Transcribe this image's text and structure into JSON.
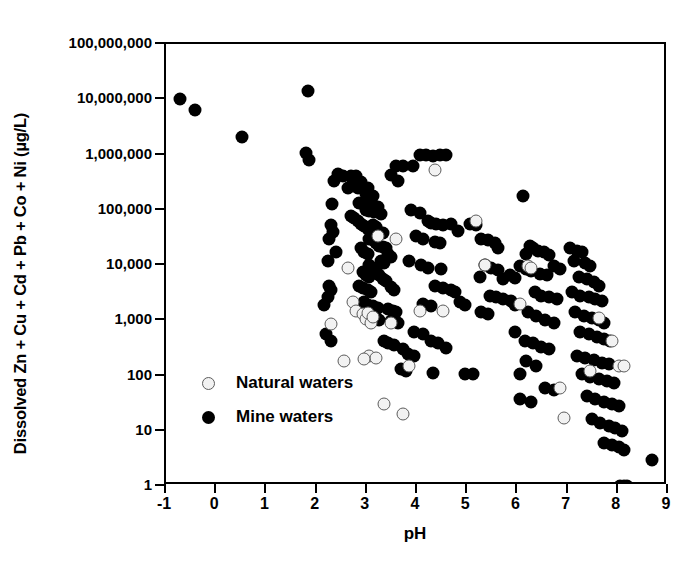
{
  "chart_data": {
    "type": "scatter",
    "title": "",
    "xlabel": "pH",
    "ylabel": "Dissolved Zn + Cu + Cd + Pb + Co + Ni (µg/L)",
    "xlim": [
      -1,
      9
    ],
    "ylim": [
      1,
      100000000
    ],
    "yscale": "log",
    "xticks": [
      "-1",
      "0",
      "1",
      "2",
      "3",
      "4",
      "5",
      "6",
      "7",
      "8",
      "9"
    ],
    "xtick_values": [
      -1,
      0,
      1,
      2,
      3,
      4,
      5,
      6,
      7,
      8,
      9
    ],
    "ytick_values": [
      1,
      10,
      100,
      1000,
      10000,
      100000,
      1000000,
      10000000,
      100000000
    ],
    "yticks": [
      "1",
      "10",
      "100",
      "1,000",
      "10,000",
      "100,000",
      "1,000,000",
      "10,000,000",
      "100,000,000"
    ],
    "grid": false,
    "legend_position": "inside-bottom-left",
    "series": [
      {
        "name": "Natural waters",
        "marker": "open-circle",
        "color": "#f2f2f2",
        "edge_color": "#5c5c5c",
        "points": [
          [
            2.28,
            850
          ],
          [
            2.62,
            9000
          ],
          [
            2.72,
            2100
          ],
          [
            2.78,
            1500
          ],
          [
            2.92,
            1300
          ],
          [
            2.98,
            1050
          ],
          [
            3.02,
            1350
          ],
          [
            3.08,
            900
          ],
          [
            3.12,
            1150
          ],
          [
            3.05,
            230
          ],
          [
            3.18,
            210
          ],
          [
            2.95,
            200
          ],
          [
            2.55,
            180
          ],
          [
            3.35,
            30
          ],
          [
            3.72,
            20
          ],
          [
            3.48,
            900
          ],
          [
            3.85,
            150
          ],
          [
            3.22,
            33000
          ],
          [
            3.58,
            30000
          ],
          [
            4.05,
            1500
          ],
          [
            4.35,
            520000
          ],
          [
            4.52,
            1500
          ],
          [
            5.18,
            62000
          ],
          [
            5.35,
            10000
          ],
          [
            6.22,
            9500
          ],
          [
            6.28,
            9000
          ],
          [
            6.05,
            2000
          ],
          [
            6.92,
            17
          ],
          [
            7.62,
            1100
          ],
          [
            7.88,
            430
          ],
          [
            8.02,
            150
          ],
          [
            8.12,
            150
          ],
          [
            7.45,
            120
          ],
          [
            6.85,
            60
          ]
        ]
      },
      {
        "name": "Mine waters",
        "marker": "filled-circle",
        "color": "#000000",
        "points": [
          [
            -0.72,
            10000000
          ],
          [
            -0.42,
            6500000
          ],
          [
            0.52,
            2100000
          ],
          [
            1.82,
            14000000
          ],
          [
            1.78,
            1050000
          ],
          [
            1.85,
            780000
          ],
          [
            2.42,
            450000
          ],
          [
            2.52,
            400000
          ],
          [
            2.35,
            330000
          ],
          [
            2.3,
            125000
          ],
          [
            2.28,
            52000
          ],
          [
            2.32,
            40000
          ],
          [
            2.25,
            30000
          ],
          [
            2.38,
            17000
          ],
          [
            2.62,
            250000
          ],
          [
            2.68,
            400000
          ],
          [
            2.72,
            330000
          ],
          [
            2.78,
            400000
          ],
          [
            2.82,
            250000
          ],
          [
            2.88,
            320000
          ],
          [
            2.92,
            250000
          ],
          [
            2.98,
            195000
          ],
          [
            3.02,
            250000
          ],
          [
            3.08,
            150000
          ],
          [
            3.12,
            180000
          ],
          [
            2.85,
            130000
          ],
          [
            2.92,
            125000
          ],
          [
            2.98,
            100000
          ],
          [
            3.05,
            95000
          ],
          [
            3.15,
            90000
          ],
          [
            3.22,
            110000
          ],
          [
            3.28,
            85000
          ],
          [
            2.68,
            78000
          ],
          [
            2.75,
            72000
          ],
          [
            2.82,
            62000
          ],
          [
            2.88,
            56000
          ],
          [
            2.95,
            50000
          ],
          [
            3.02,
            45000
          ],
          [
            3.12,
            52000
          ],
          [
            3.18,
            48000
          ],
          [
            3.25,
            40000
          ],
          [
            3.32,
            38000
          ],
          [
            3.05,
            30000
          ],
          [
            3.12,
            28000
          ],
          [
            3.18,
            25000
          ],
          [
            3.25,
            22000
          ],
          [
            3.32,
            21000
          ],
          [
            3.38,
            20000
          ],
          [
            2.88,
            20000
          ],
          [
            2.95,
            17000
          ],
          [
            3.02,
            16000
          ],
          [
            3.42,
            16000
          ],
          [
            3.48,
            14000
          ],
          [
            3.28,
            12000
          ],
          [
            3.35,
            11000
          ],
          [
            3.05,
            10000
          ],
          [
            3.12,
            9000
          ],
          [
            3.18,
            8000
          ],
          [
            2.92,
            7500
          ],
          [
            2.98,
            6500
          ],
          [
            3.05,
            6000
          ],
          [
            3.25,
            6500
          ],
          [
            3.32,
            5500
          ],
          [
            3.38,
            5200
          ],
          [
            2.85,
            4200
          ],
          [
            2.92,
            3800
          ],
          [
            3.02,
            3500
          ],
          [
            3.08,
            3200
          ],
          [
            3.48,
            4000
          ],
          [
            3.55,
            3500
          ],
          [
            2.95,
            2100
          ],
          [
            3.02,
            1900
          ],
          [
            3.12,
            1800
          ],
          [
            3.22,
            1700
          ],
          [
            2.88,
            1500
          ],
          [
            3.42,
            1600
          ],
          [
            3.52,
            1500
          ],
          [
            3.58,
            1400
          ],
          [
            3.18,
            1100
          ],
          [
            3.25,
            1000
          ],
          [
            3.48,
            950
          ],
          [
            3.62,
            900
          ],
          [
            3.35,
            420
          ],
          [
            3.42,
            380
          ],
          [
            3.55,
            350
          ],
          [
            3.72,
            300
          ],
          [
            3.82,
            250
          ],
          [
            3.95,
            230
          ],
          [
            3.68,
            130
          ],
          [
            3.78,
            120
          ],
          [
            2.22,
            12000
          ],
          [
            2.25,
            4200
          ],
          [
            2.28,
            3600
          ],
          [
            2.22,
            2600
          ],
          [
            2.18,
            560
          ],
          [
            2.28,
            420
          ],
          [
            2.15,
            1900
          ],
          [
            3.58,
            620000
          ],
          [
            3.72,
            620000
          ],
          [
            3.92,
            610000
          ],
          [
            4.05,
            1000000
          ],
          [
            4.18,
            1000000
          ],
          [
            4.32,
            950000
          ],
          [
            4.45,
            980000
          ],
          [
            4.58,
            1000000
          ],
          [
            3.48,
            420000
          ],
          [
            3.62,
            330000
          ],
          [
            3.88,
            100000
          ],
          [
            4.05,
            88000
          ],
          [
            4.22,
            62000
          ],
          [
            4.28,
            58000
          ],
          [
            4.38,
            56000
          ],
          [
            4.52,
            52000
          ],
          [
            3.98,
            33000
          ],
          [
            4.12,
            30000
          ],
          [
            4.35,
            26000
          ],
          [
            4.45,
            25000
          ],
          [
            4.68,
            56000
          ],
          [
            4.82,
            42000
          ],
          [
            3.85,
            12000
          ],
          [
            4.08,
            10000
          ],
          [
            4.22,
            9000
          ],
          [
            4.48,
            8500
          ],
          [
            4.35,
            4200
          ],
          [
            4.52,
            3800
          ],
          [
            4.68,
            3500
          ],
          [
            4.75,
            3200
          ],
          [
            4.12,
            2000
          ],
          [
            4.28,
            1800
          ],
          [
            4.85,
            2100
          ],
          [
            4.95,
            1900
          ],
          [
            3.95,
            620
          ],
          [
            4.12,
            560
          ],
          [
            4.28,
            420
          ],
          [
            4.42,
            380
          ],
          [
            4.58,
            320
          ],
          [
            4.32,
            110
          ],
          [
            5.12,
            105
          ],
          [
            5.05,
            55000
          ],
          [
            5.18,
            52000
          ],
          [
            5.28,
            30000
          ],
          [
            5.42,
            28000
          ],
          [
            5.55,
            25000
          ],
          [
            5.62,
            20000
          ],
          [
            5.35,
            10000
          ],
          [
            5.48,
            9000
          ],
          [
            5.62,
            8000
          ],
          [
            5.25,
            6000
          ],
          [
            5.72,
            5500
          ],
          [
            5.85,
            6500
          ],
          [
            5.95,
            5800
          ],
          [
            5.45,
            2800
          ],
          [
            5.58,
            2600
          ],
          [
            5.72,
            2400
          ],
          [
            5.88,
            2200
          ],
          [
            5.95,
            1900
          ],
          [
            5.28,
            1400
          ],
          [
            5.42,
            1300
          ],
          [
            6.12,
            180000
          ],
          [
            6.25,
            22000
          ],
          [
            6.32,
            20000
          ],
          [
            6.42,
            18000
          ],
          [
            6.18,
            16000
          ],
          [
            6.52,
            17000
          ],
          [
            6.62,
            15000
          ],
          [
            6.05,
            9500
          ],
          [
            6.18,
            8500
          ],
          [
            6.28,
            7800
          ],
          [
            6.45,
            7000
          ],
          [
            6.58,
            6500
          ],
          [
            6.72,
            9500
          ],
          [
            6.85,
            8500
          ],
          [
            6.35,
            3200
          ],
          [
            6.48,
            2800
          ],
          [
            6.62,
            2600
          ],
          [
            6.78,
            2400
          ],
          [
            6.22,
            1400
          ],
          [
            6.38,
            1200
          ],
          [
            6.55,
            1000
          ],
          [
            6.72,
            900
          ],
          [
            6.15,
            420
          ],
          [
            6.32,
            380
          ],
          [
            6.48,
            330
          ],
          [
            6.62,
            300
          ],
          [
            6.18,
            180
          ],
          [
            6.38,
            150
          ],
          [
            6.05,
            38
          ],
          [
            6.28,
            33
          ],
          [
            6.55,
            60
          ],
          [
            6.72,
            55
          ],
          [
            7.05,
            20000
          ],
          [
            7.18,
            18000
          ],
          [
            7.28,
            17000
          ],
          [
            7.12,
            12000
          ],
          [
            7.35,
            11000
          ],
          [
            7.45,
            9500
          ],
          [
            7.22,
            6000
          ],
          [
            7.38,
            5500
          ],
          [
            7.52,
            5000
          ],
          [
            7.62,
            4200
          ],
          [
            7.08,
            3200
          ],
          [
            7.25,
            2800
          ],
          [
            7.42,
            2600
          ],
          [
            7.55,
            2400
          ],
          [
            7.68,
            2200
          ],
          [
            7.15,
            1400
          ],
          [
            7.32,
            1200
          ],
          [
            7.48,
            1100
          ],
          [
            7.62,
            1000
          ],
          [
            7.72,
            900
          ],
          [
            7.25,
            620
          ],
          [
            7.42,
            560
          ],
          [
            7.58,
            500
          ],
          [
            7.72,
            450
          ],
          [
            7.85,
            420
          ],
          [
            7.18,
            230
          ],
          [
            7.35,
            210
          ],
          [
            7.52,
            190
          ],
          [
            7.68,
            170
          ],
          [
            7.82,
            160
          ],
          [
            7.28,
            105
          ],
          [
            7.45,
            95
          ],
          [
            7.62,
            85
          ],
          [
            7.78,
            78
          ],
          [
            7.92,
            72
          ],
          [
            7.38,
            42
          ],
          [
            7.55,
            38
          ],
          [
            7.72,
            33
          ],
          [
            7.88,
            30
          ],
          [
            8.02,
            28
          ],
          [
            7.48,
            16
          ],
          [
            7.65,
            14
          ],
          [
            7.82,
            12
          ],
          [
            7.95,
            11
          ],
          [
            8.08,
            10
          ],
          [
            7.72,
            6
          ],
          [
            7.88,
            5.5
          ],
          [
            8.02,
            5
          ],
          [
            8.12,
            4.5
          ],
          [
            8.05,
            1
          ],
          [
            8.12,
            1
          ],
          [
            8.18,
            1
          ],
          [
            8.68,
            3
          ],
          [
            5.95,
            620
          ],
          [
            6.05,
            105
          ],
          [
            4.95,
            105
          ]
        ]
      }
    ]
  },
  "legend": {
    "items": [
      {
        "label": "Natural waters",
        "marker": "open-circle"
      },
      {
        "label": "Mine waters",
        "marker": "filled-circle"
      }
    ]
  }
}
